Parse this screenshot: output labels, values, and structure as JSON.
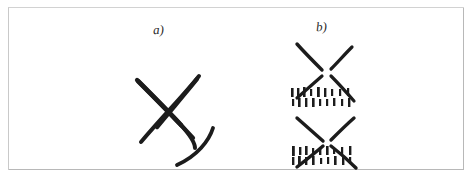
{
  "figure": {
    "background_color": "#ffffff",
    "ink_color": "#1c1c1c",
    "frame_color": "#b8b8b8",
    "panels": [
      {
        "id": "a",
        "label": "a)",
        "description": "solid hand-drawn X with a detached curved stroke at lower right",
        "elements": [
          {
            "name": "x-stroke-down-right",
            "type": "stroke",
            "path": "M 10 14 C 26 30, 46 50, 66 72"
          },
          {
            "name": "x-stroke-down-left",
            "type": "stroke",
            "path": "M 72 10 C 56 30, 36 50, 14 76"
          },
          {
            "name": "detached-curved-stroke",
            "type": "stroke",
            "path": "M 84 63 C 80 76, 68 90, 50 98"
          }
        ]
      },
      {
        "id": "b",
        "label": "b)",
        "description": "two exploded X figures built from separate radiating strokes, each followed by two rows of short vertical tick marks",
        "elements": [
          {
            "name": "upper-x-arm-top-left",
            "type": "stroke",
            "path": "M 14 8 L 38 34"
          },
          {
            "name": "upper-x-arm-top-right",
            "type": "stroke",
            "path": "M 68 11 L 48 33"
          },
          {
            "name": "upper-x-arm-bottom-left",
            "type": "stroke",
            "path": "M 38 40 L 14 62"
          },
          {
            "name": "upper-x-arm-bottom-right",
            "type": "stroke",
            "path": "M 48 40 L 70 64"
          },
          {
            "name": "tick-row-upper-first",
            "type": "tick-row",
            "y": 56,
            "count": 9
          },
          {
            "name": "tick-row-upper-second",
            "type": "tick-row",
            "y": 66,
            "count": 9
          },
          {
            "name": "lower-x-arm-top-left",
            "type": "stroke",
            "path": "M 14 82 L 40 104"
          },
          {
            "name": "lower-x-arm-top-right",
            "type": "stroke",
            "path": "M 70 82 L 48 104"
          },
          {
            "name": "lower-x-arm-bottom-left",
            "type": "stroke",
            "path": "M 40 110 L 14 130"
          },
          {
            "name": "lower-x-arm-bottom-right",
            "type": "stroke",
            "path": "M 48 110 L 72 131"
          },
          {
            "name": "tick-row-lower-first",
            "type": "tick-row",
            "y": 114,
            "count": 9
          },
          {
            "name": "tick-row-lower-second",
            "type": "tick-row",
            "y": 124,
            "count": 9
          }
        ]
      }
    ]
  }
}
